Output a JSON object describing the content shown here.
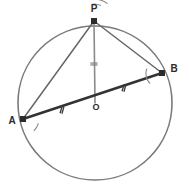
{
  "figure": {
    "kind": "circle-geometry-diagram",
    "width": 189,
    "height": 187,
    "background_color": "#ffffff"
  },
  "circle": {
    "name": "main-circle",
    "center_x": 95,
    "center_y": 103,
    "radius": 77,
    "stroke_color": "#7a7a7a",
    "stroke_width": 1.6
  },
  "points": [
    {
      "id": "P",
      "label": "P",
      "x": 94,
      "y": 21,
      "label_x": 94,
      "label_y": 12,
      "on_circle": true
    },
    {
      "id": "B",
      "label": "B",
      "x": 162,
      "y": 73,
      "label_x": 174,
      "label_y": 72,
      "on_circle": true
    },
    {
      "id": "A",
      "label": "A",
      "x": 23,
      "y": 119,
      "label_x": 12,
      "label_y": 124,
      "on_circle": true
    },
    {
      "id": "O",
      "label": "O",
      "x": 95,
      "y": 103,
      "label_x": 96,
      "label_y": 110,
      "on_circle": false
    }
  ],
  "segments": [
    {
      "id": "AB",
      "name": "chord-ab",
      "from": "A",
      "to": "B",
      "style": "thick",
      "color": "#333333",
      "width": 2.6
    },
    {
      "id": "PA",
      "name": "segment-pa",
      "from": "P",
      "to": "A",
      "style": "thin",
      "color": "#666666",
      "width": 1.5
    },
    {
      "id": "PB",
      "name": "segment-pb",
      "from": "P",
      "to": "B",
      "style": "thin",
      "color": "#666666",
      "width": 1.5
    },
    {
      "id": "PO",
      "name": "radius-po",
      "from": "P",
      "to": "O",
      "style": "thin",
      "color": "#8a8a8a",
      "width": 1.6
    }
  ],
  "tick_marks": [
    {
      "id": "tick-ao",
      "name": "congruence-tick-ao",
      "on_segment": "AO",
      "count": 2,
      "x": 62,
      "y": 110,
      "angle_deg": -15.9,
      "color": "#3a3a3a"
    },
    {
      "id": "tick-ob",
      "name": "congruence-tick-ob",
      "on_segment": "OB",
      "count": 2,
      "x": 124,
      "y": 88,
      "angle_deg": -15.9,
      "color": "#3a3a3a"
    },
    {
      "id": "tick-po",
      "name": "congruence-tick-po",
      "on_segment": "PO",
      "count": 2,
      "x": 94,
      "y": 64,
      "angle_deg": 90,
      "color": "#7f7f7f"
    }
  ],
  "angle_arcs": [
    {
      "id": "arc-apo",
      "name": "angle-arc-at-p-left",
      "vertex": "P",
      "radius": 17,
      "start_deg": 95,
      "end_deg": 66,
      "color": "#8a8a8a"
    },
    {
      "id": "arc-opb",
      "name": "angle-arc-at-p-right",
      "vertex": "P",
      "radius": 22,
      "start_deg": 90,
      "end_deg": 52,
      "color": "#8a8a8a"
    },
    {
      "id": "arc-a",
      "name": "angle-arc-at-a",
      "vertex": "A",
      "radius": 16,
      "start_deg": -16,
      "end_deg": -48,
      "color": "#8a8a8a"
    },
    {
      "id": "arc-b",
      "name": "angle-arc-at-b",
      "vertex": "B",
      "radius": 16,
      "start_deg": 164,
      "end_deg": 222,
      "color": "#8a8a8a"
    }
  ],
  "chart_data": {
    "type": "diagram",
    "title": "",
    "shapes": [
      "circle",
      "triangle",
      "radius"
    ],
    "labels": [
      "P",
      "A",
      "B",
      "O"
    ]
  }
}
